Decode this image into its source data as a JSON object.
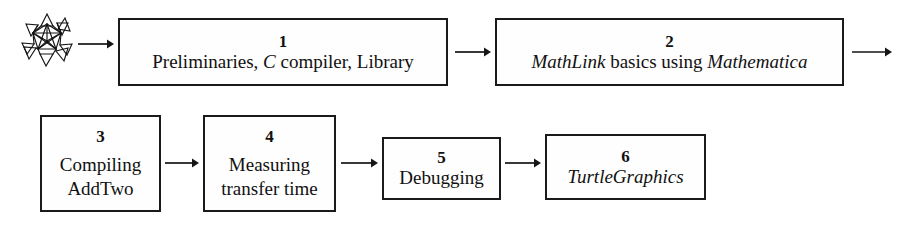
{
  "diagram": {
    "background_color": "#ffffff",
    "line_color": "#1a1a1a",
    "icon": {
      "name": "stellated-polyhedron-icon",
      "description": "Mathematica spikey wireframe polyhedron"
    },
    "nodes": [
      {
        "number": "1",
        "label_plain": "Preliminaries, C compiler, Library",
        "label_parts": [
          {
            "text": "Preliminaries, ",
            "style": "roman"
          },
          {
            "text": "C",
            "style": "italic"
          },
          {
            "text": " compiler, Library",
            "style": "roman"
          }
        ]
      },
      {
        "number": "2",
        "label_plain": "MathLink basics using Mathematica",
        "label_parts": [
          {
            "text": "MathLink",
            "style": "italic"
          },
          {
            "text": " basics using ",
            "style": "roman"
          },
          {
            "text": "Mathematica",
            "style": "italic"
          }
        ]
      },
      {
        "number": "3",
        "label_plain": "Compiling AddTwo",
        "label_lines": [
          "Compiling",
          "AddTwo"
        ]
      },
      {
        "number": "4",
        "label_plain": "Measuring transfer time",
        "label_lines": [
          "Measuring",
          "transfer time"
        ]
      },
      {
        "number": "5",
        "label_plain": "Debugging",
        "label_parts": [
          {
            "text": "Debugging",
            "style": "roman"
          }
        ]
      },
      {
        "number": "6",
        "label_plain": "TurtleGraphics",
        "label_parts": [
          {
            "text": "TurtleGraphics",
            "style": "italic"
          }
        ]
      }
    ],
    "arrows": [
      {
        "name": "icon-to-node-1",
        "from": "spikey-icon",
        "to": "node-1",
        "direction": "right"
      },
      {
        "name": "node-1-to-node-2",
        "from": "node-1",
        "to": "node-2",
        "direction": "right"
      },
      {
        "name": "node-2-outgoing",
        "from": "node-2",
        "to": "node-3",
        "direction": "right"
      },
      {
        "name": "node-3-to-node-4",
        "from": "node-3",
        "to": "node-4",
        "direction": "right"
      },
      {
        "name": "node-4-to-node-5",
        "from": "node-4",
        "to": "node-5",
        "direction": "right"
      },
      {
        "name": "node-5-to-node-6",
        "from": "node-5",
        "to": "node-6",
        "direction": "right"
      }
    ]
  }
}
